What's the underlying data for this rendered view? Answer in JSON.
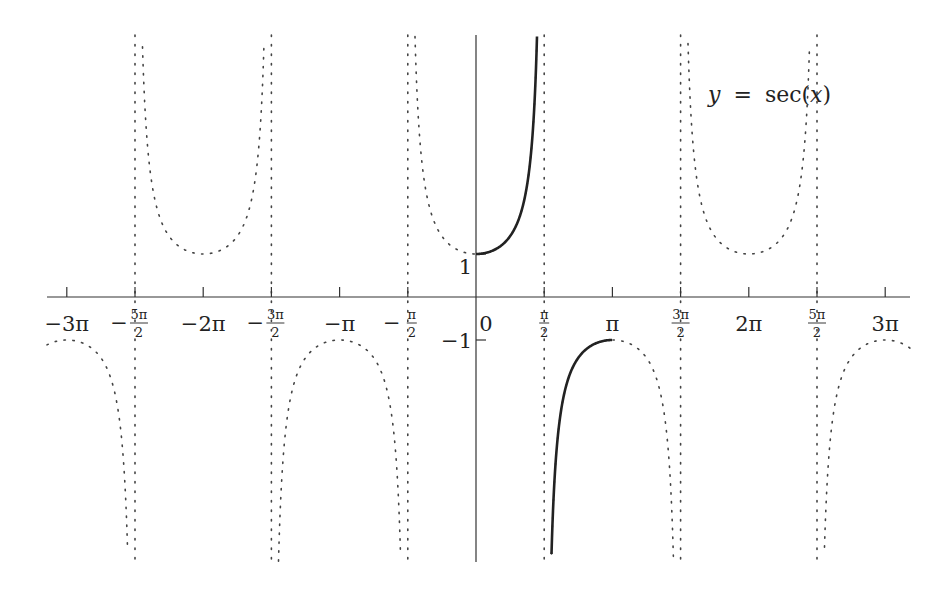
{
  "chart_data": {
    "type": "line",
    "title": "y = sec(x)",
    "title_parts": {
      "lhs": "y",
      "eq": "=",
      "fn": "sec",
      "arg": "x"
    },
    "xlabel": "",
    "ylabel": "",
    "function": "sec(x)",
    "xlim": [
      -9.7,
      9.7
    ],
    "ylim": [
      -6.1,
      6.1
    ],
    "grid": false,
    "legend": "none",
    "x_ticks": [
      {
        "value": -9.4248,
        "label": "−3π",
        "frac": false
      },
      {
        "value": -7.854,
        "label_num": "5π",
        "label_den": "2",
        "sign": "−",
        "frac": true
      },
      {
        "value": -6.2832,
        "label": "−2π",
        "frac": false
      },
      {
        "value": -4.7124,
        "label_num": "3π",
        "label_den": "2",
        "sign": "−",
        "frac": true
      },
      {
        "value": -3.1416,
        "label": "−π",
        "frac": false
      },
      {
        "value": -1.5708,
        "label_num": "π",
        "label_den": "2",
        "sign": "−",
        "frac": true
      },
      {
        "value": 0,
        "label": "0",
        "frac": false
      },
      {
        "value": 1.5708,
        "label_num": "π",
        "label_den": "2",
        "sign": "",
        "frac": true
      },
      {
        "value": 3.1416,
        "label": "π",
        "frac": false
      },
      {
        "value": 4.7124,
        "label_num": "3π",
        "label_den": "2",
        "sign": "",
        "frac": true
      },
      {
        "value": 6.2832,
        "label": "2π",
        "frac": false
      },
      {
        "value": 7.854,
        "label_num": "5π",
        "label_den": "2",
        "sign": "",
        "frac": true
      },
      {
        "value": 9.4248,
        "label": "3π",
        "frac": false
      }
    ],
    "y_ticks": [
      {
        "value": 1,
        "label": "1"
      },
      {
        "value": -1,
        "label": "−1"
      }
    ],
    "asymptotes": [
      -7.854,
      -4.7124,
      -1.5708,
      1.5708,
      4.7124,
      7.854
    ],
    "series": [
      {
        "name": "sec(x) full (dotted)",
        "style": "dotted",
        "x_range": [
          -9.7,
          9.7
        ],
        "key_points": [
          [
            -9.4248,
            -1
          ],
          [
            -6.2832,
            1
          ],
          [
            -3.1416,
            -1
          ],
          [
            0,
            1
          ],
          [
            3.1416,
            -1
          ],
          [
            6.2832,
            1
          ],
          [
            9.4248,
            -1
          ]
        ]
      },
      {
        "name": "sec(x) principal branch (solid)",
        "style": "solid",
        "x_range": [
          0,
          3.1416
        ],
        "key_points": [
          [
            0,
            1
          ],
          [
            0.7854,
            1.414
          ],
          [
            1.0472,
            2
          ],
          [
            1.3,
            3.74
          ],
          [
            2.094,
            -2
          ],
          [
            2.356,
            -1.414
          ],
          [
            3.1416,
            -1
          ]
        ]
      }
    ],
    "colors": {
      "curve": "#222222",
      "axis": "#333333",
      "dotted": "#444444"
    }
  }
}
